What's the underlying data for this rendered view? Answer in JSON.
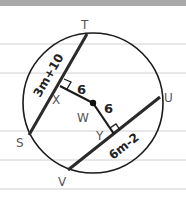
{
  "diagram": {
    "type": "circle-chords",
    "colors": {
      "background": "#ffffff",
      "top_band": "#a9a9a9",
      "ruled_line": "#d0d0d0",
      "ink": "#1a1a1a",
      "point_label": "#555555"
    },
    "points": {
      "T": "T",
      "S": "S",
      "U": "U",
      "V": "V",
      "W": "W",
      "X": "X",
      "Y": "Y"
    },
    "chords": [
      {
        "name": "chord-ST",
        "endpoints": [
          "S",
          "T"
        ],
        "label": "3m+10"
      },
      {
        "name": "chord-VU",
        "endpoints": [
          "V",
          "U"
        ],
        "label": "6m-2"
      }
    ],
    "perpendiculars": [
      {
        "name": "segment-WX",
        "from": "W",
        "to": "X",
        "length_label": "6"
      },
      {
        "name": "segment-WY",
        "from": "W",
        "to": "Y",
        "length_label": "6"
      }
    ],
    "center": "W"
  }
}
